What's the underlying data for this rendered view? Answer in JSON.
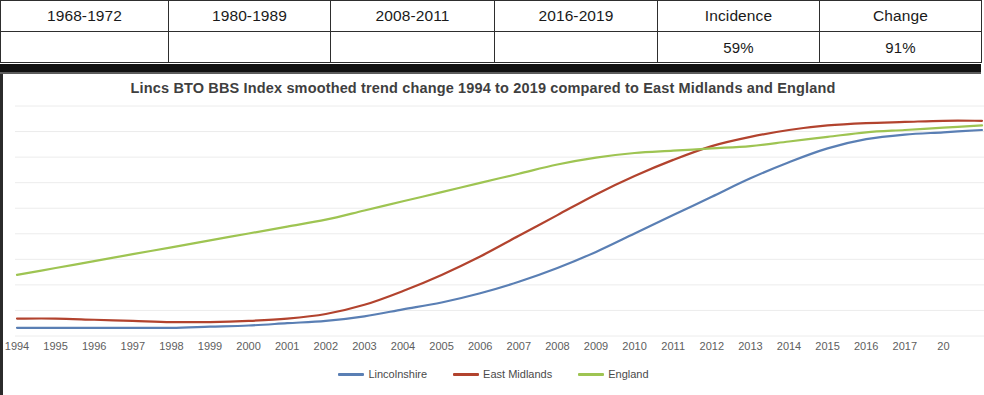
{
  "summary_table": {
    "columns": [
      "1968-1972",
      "1980-1989",
      "2008-2011",
      "2016-2019",
      "Incidence",
      "Change"
    ],
    "values": [
      "",
      "",
      "",
      "",
      "59%",
      "91%"
    ],
    "cell_fills": [
      "black",
      "white",
      "green",
      "green",
      "white",
      "white"
    ],
    "colors": {
      "black": "#060606",
      "green": "#4f7c4a",
      "white": "#ffffff",
      "border": "#2e2e2e"
    }
  },
  "chart_data": {
    "type": "line",
    "title": "Lincs BTO BBS Index smoothed trend change 1994 to 2019 compared to East Midlands and England",
    "xlabel": "",
    "ylabel": "",
    "grid": true,
    "legend_position": "bottom",
    "x": [
      1994,
      1995,
      1996,
      1997,
      1998,
      1999,
      2000,
      2001,
      2002,
      2003,
      2004,
      2005,
      2006,
      2007,
      2008,
      2009,
      2010,
      2011,
      2012,
      2013,
      2014,
      2015,
      2016,
      2017,
      2018,
      2019
    ],
    "tick_labels": [
      "1994",
      "1995",
      "1996",
      "1997",
      "1998",
      "1999",
      "2000",
      "2001",
      "2002",
      "2003",
      "2004",
      "2005",
      "2006",
      "2007",
      "2008",
      "2009",
      "2010",
      "2011",
      "2012",
      "2013",
      "2014",
      "2015",
      "2016",
      "2017",
      "20"
    ],
    "ylim": [
      0,
      100
    ],
    "series": [
      {
        "name": "Lincolnshire",
        "color": "#5a7fb4",
        "values": [
          4,
          4,
          4,
          4,
          4,
          4.5,
          5,
          6,
          7,
          9,
          12,
          15,
          19,
          24,
          30,
          37,
          45,
          53,
          61,
          69,
          76,
          82,
          86,
          88,
          89,
          90
        ]
      },
      {
        "name": "East Midlands",
        "color": "#b2432e",
        "values": [
          8,
          8,
          7.5,
          7,
          6.5,
          6.5,
          7,
          8,
          10,
          14,
          20,
          27,
          35,
          44,
          53,
          62,
          70,
          77,
          83,
          87,
          90,
          92,
          93,
          93.5,
          94,
          94
        ]
      },
      {
        "name": "England",
        "color": "#9ec452",
        "values": [
          27,
          30,
          33,
          36,
          39,
          42,
          45,
          48,
          51,
          55,
          59,
          63,
          67,
          71,
          75,
          78,
          80,
          81,
          82,
          83,
          85,
          87,
          89,
          90,
          91,
          92
        ]
      }
    ]
  }
}
